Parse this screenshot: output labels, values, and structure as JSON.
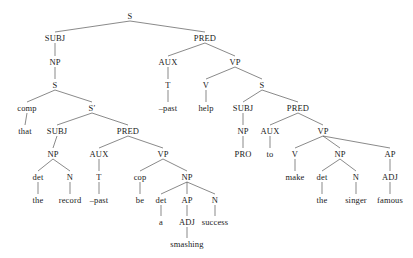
{
  "diagram": {
    "type": "constituency-syntax-tree",
    "background_color": "#ffffff",
    "line_color": "#3a3a3a",
    "text_color": "#1a1a1a",
    "width": 413,
    "height": 258,
    "sentence": "That the record was a smashing success helped to make the singer famous.",
    "nodes": [
      {
        "id": "n0",
        "label": "S",
        "kind": "category",
        "x": 130,
        "y": 16
      },
      {
        "id": "n1",
        "label": "SUBJ",
        "kind": "category",
        "x": 55,
        "y": 38
      },
      {
        "id": "n2",
        "label": "PRED",
        "kind": "category",
        "x": 205,
        "y": 38
      },
      {
        "id": "n3",
        "label": "NP",
        "kind": "category",
        "x": 55,
        "y": 62
      },
      {
        "id": "n4",
        "label": "AUX",
        "kind": "category",
        "x": 168,
        "y": 62
      },
      {
        "id": "n5",
        "label": "VP",
        "kind": "category",
        "x": 235,
        "y": 62
      },
      {
        "id": "n6",
        "label": "S",
        "kind": "category",
        "x": 55,
        "y": 85
      },
      {
        "id": "n7",
        "label": "T",
        "kind": "category",
        "x": 168,
        "y": 85
      },
      {
        "id": "n8",
        "label": "V",
        "kind": "category",
        "x": 206,
        "y": 85
      },
      {
        "id": "n9",
        "label": "S",
        "kind": "category",
        "x": 262,
        "y": 85
      },
      {
        "id": "n10",
        "label": "comp",
        "kind": "category",
        "x": 27,
        "y": 108
      },
      {
        "id": "n11",
        "label": "S′",
        "kind": "category",
        "x": 92,
        "y": 108
      },
      {
        "id": "n12",
        "label": "–past",
        "kind": "leaf",
        "x": 168,
        "y": 108
      },
      {
        "id": "n13",
        "label": "help",
        "kind": "leaf",
        "x": 206,
        "y": 108
      },
      {
        "id": "n14",
        "label": "SUBJ",
        "kind": "category",
        "x": 243,
        "y": 108
      },
      {
        "id": "n15",
        "label": "PRED",
        "kind": "category",
        "x": 298,
        "y": 108
      },
      {
        "id": "n16",
        "label": "that",
        "kind": "leaf",
        "x": 25,
        "y": 131
      },
      {
        "id": "n17",
        "label": "SUBJ",
        "kind": "category",
        "x": 57,
        "y": 131
      },
      {
        "id": "n18",
        "label": "PRED",
        "kind": "category",
        "x": 128,
        "y": 131
      },
      {
        "id": "n19",
        "label": "NP",
        "kind": "category",
        "x": 243,
        "y": 131
      },
      {
        "id": "n20",
        "label": "AUX",
        "kind": "category",
        "x": 270,
        "y": 131
      },
      {
        "id": "n21",
        "label": "VP",
        "kind": "category",
        "x": 323,
        "y": 131
      },
      {
        "id": "n22",
        "label": "NP",
        "kind": "category",
        "x": 53,
        "y": 154
      },
      {
        "id": "n23",
        "label": "AUX",
        "kind": "category",
        "x": 99,
        "y": 154
      },
      {
        "id": "n24",
        "label": "VP",
        "kind": "category",
        "x": 163,
        "y": 154
      },
      {
        "id": "n25",
        "label": "PRO",
        "kind": "leaf",
        "x": 243,
        "y": 154
      },
      {
        "id": "n26",
        "label": "to",
        "kind": "leaf",
        "x": 270,
        "y": 154
      },
      {
        "id": "n27",
        "label": "V",
        "kind": "category",
        "x": 295,
        "y": 154
      },
      {
        "id": "n28",
        "label": "NP",
        "kind": "category",
        "x": 340,
        "y": 154
      },
      {
        "id": "n29",
        "label": "AP",
        "kind": "category",
        "x": 390,
        "y": 154
      },
      {
        "id": "n30",
        "label": "det",
        "kind": "category",
        "x": 38,
        "y": 177
      },
      {
        "id": "n31",
        "label": "N",
        "kind": "category",
        "x": 70,
        "y": 177
      },
      {
        "id": "n32",
        "label": "T",
        "kind": "category",
        "x": 99,
        "y": 177
      },
      {
        "id": "n33",
        "label": "cop",
        "kind": "category",
        "x": 140,
        "y": 177
      },
      {
        "id": "n34",
        "label": "NP",
        "kind": "category",
        "x": 187,
        "y": 177
      },
      {
        "id": "n35",
        "label": "make",
        "kind": "leaf",
        "x": 295,
        "y": 177
      },
      {
        "id": "n36",
        "label": "det",
        "kind": "category",
        "x": 322,
        "y": 177
      },
      {
        "id": "n37",
        "label": "N",
        "kind": "category",
        "x": 356,
        "y": 177
      },
      {
        "id": "n38",
        "label": "ADJ",
        "kind": "category",
        "x": 390,
        "y": 177
      },
      {
        "id": "n39",
        "label": "the",
        "kind": "leaf",
        "x": 38,
        "y": 200
      },
      {
        "id": "n40",
        "label": "record",
        "kind": "leaf",
        "x": 70,
        "y": 200
      },
      {
        "id": "n41",
        "label": "–past",
        "kind": "leaf",
        "x": 99,
        "y": 200
      },
      {
        "id": "n42",
        "label": "be",
        "kind": "leaf",
        "x": 140,
        "y": 200
      },
      {
        "id": "n43",
        "label": "det",
        "kind": "category",
        "x": 161,
        "y": 200
      },
      {
        "id": "n44",
        "label": "AP",
        "kind": "category",
        "x": 187,
        "y": 200
      },
      {
        "id": "n45",
        "label": "N",
        "kind": "category",
        "x": 215,
        "y": 200
      },
      {
        "id": "n46",
        "label": "the",
        "kind": "leaf",
        "x": 322,
        "y": 200
      },
      {
        "id": "n47",
        "label": "singer",
        "kind": "leaf",
        "x": 356,
        "y": 200
      },
      {
        "id": "n48",
        "label": "famous",
        "kind": "leaf",
        "x": 390,
        "y": 200
      },
      {
        "id": "n49",
        "label": "a",
        "kind": "leaf",
        "x": 161,
        "y": 222
      },
      {
        "id": "n50",
        "label": "ADJ",
        "kind": "category",
        "x": 187,
        "y": 222
      },
      {
        "id": "n51",
        "label": "success",
        "kind": "leaf",
        "x": 215,
        "y": 222
      },
      {
        "id": "n52",
        "label": "smashing",
        "kind": "leaf",
        "x": 187,
        "y": 244
      }
    ],
    "edges": [
      [
        "n0",
        "n1"
      ],
      [
        "n0",
        "n2"
      ],
      [
        "n1",
        "n3"
      ],
      [
        "n2",
        "n4"
      ],
      [
        "n2",
        "n5"
      ],
      [
        "n3",
        "n6"
      ],
      [
        "n4",
        "n7"
      ],
      [
        "n5",
        "n8"
      ],
      [
        "n5",
        "n9"
      ],
      [
        "n6",
        "n10"
      ],
      [
        "n6",
        "n11"
      ],
      [
        "n7",
        "n12"
      ],
      [
        "n8",
        "n13"
      ],
      [
        "n9",
        "n14"
      ],
      [
        "n9",
        "n15"
      ],
      [
        "n10",
        "n16"
      ],
      [
        "n11",
        "n17"
      ],
      [
        "n11",
        "n18"
      ],
      [
        "n14",
        "n19"
      ],
      [
        "n15",
        "n20"
      ],
      [
        "n15",
        "n21"
      ],
      [
        "n17",
        "n22"
      ],
      [
        "n18",
        "n23"
      ],
      [
        "n18",
        "n24"
      ],
      [
        "n19",
        "n25"
      ],
      [
        "n20",
        "n26"
      ],
      [
        "n21",
        "n27"
      ],
      [
        "n21",
        "n28"
      ],
      [
        "n21",
        "n29"
      ],
      [
        "n22",
        "n30"
      ],
      [
        "n22",
        "n31"
      ],
      [
        "n23",
        "n32"
      ],
      [
        "n24",
        "n33"
      ],
      [
        "n24",
        "n34"
      ],
      [
        "n27",
        "n35"
      ],
      [
        "n28",
        "n36"
      ],
      [
        "n28",
        "n37"
      ],
      [
        "n29",
        "n38"
      ],
      [
        "n30",
        "n39"
      ],
      [
        "n31",
        "n40"
      ],
      [
        "n32",
        "n41"
      ],
      [
        "n33",
        "n42"
      ],
      [
        "n34",
        "n43"
      ],
      [
        "n34",
        "n44"
      ],
      [
        "n34",
        "n45"
      ],
      [
        "n36",
        "n46"
      ],
      [
        "n37",
        "n47"
      ],
      [
        "n38",
        "n48"
      ],
      [
        "n43",
        "n49"
      ],
      [
        "n44",
        "n50"
      ],
      [
        "n45",
        "n51"
      ],
      [
        "n50",
        "n52"
      ]
    ]
  }
}
